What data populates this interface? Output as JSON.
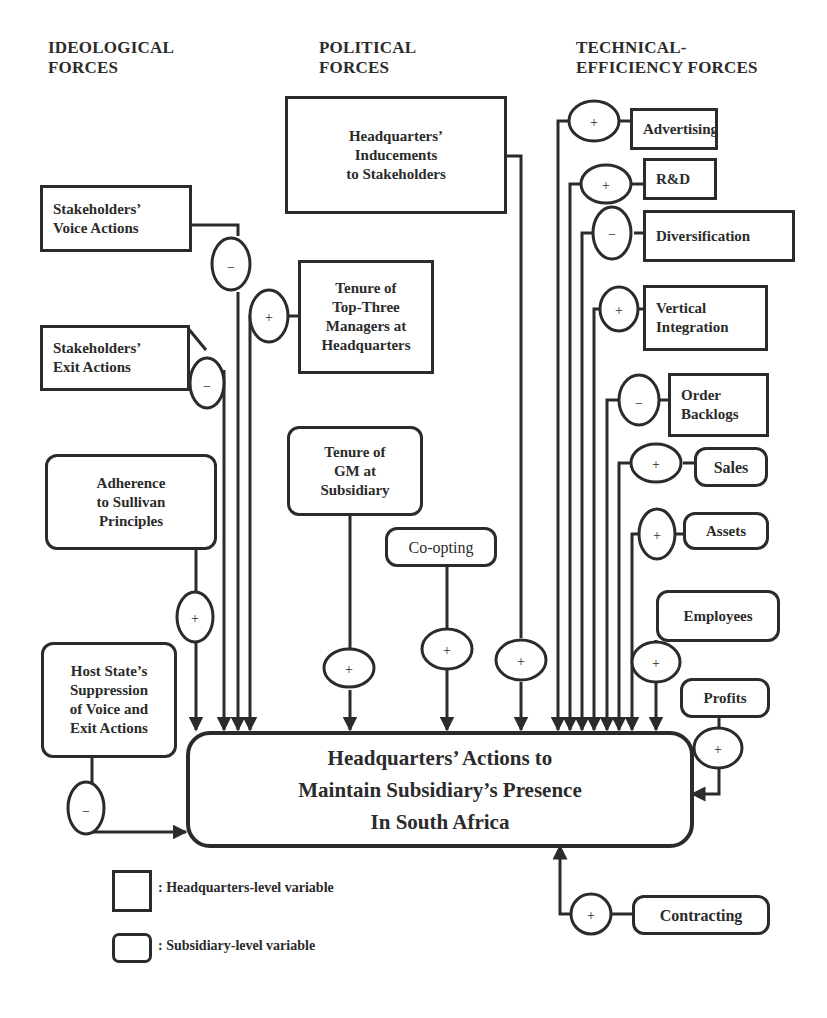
{
  "headings": {
    "ideological": "IDEOLOGICAL\nFORCES",
    "political": "POLITICAL\nFORCES",
    "technical": "TECHNICAL-\nEFFICIENCY FORCES"
  },
  "central": {
    "label": "Headquarters’ Actions to\nMaintain Subsidiary’s Presence\nIn South Africa"
  },
  "nodes": {
    "hq_inducements": "Headquarters’\nInducements\nto Stakeholders",
    "voice_actions": "Stakeholders’\nVoice Actions",
    "exit_actions": "Stakeholders’\nExit Actions",
    "tenure_top_three": "Tenure of\nTop-Three\nManagers at\nHeadquarters",
    "sullivan": "Adherence\nto Sullivan\nPrinciples",
    "host_state": "Host State’s\nSuppression\nof Voice and\nExit Actions",
    "tenure_gm": "Tenure of\nGM at\nSubsidiary",
    "co_opting": "Co-opting",
    "advertising": "Advertising",
    "rd": "R&D",
    "diversification": "Diversification",
    "vertical_integration": "Vertical\nIntegration",
    "order_backlogs": "Order\nBacklogs",
    "sales": "Sales",
    "assets": "Assets",
    "employees": "Employees",
    "profits": "Profits",
    "contracting": "Contracting"
  },
  "signs": {
    "voice_actions": "−",
    "exit_actions": "−",
    "tenure_top_three": "+",
    "sullivan": "+",
    "host_state": "−",
    "tenure_gm": "+",
    "co_opting": "+",
    "hq_inducements": "+",
    "advertising": "+",
    "rd": "+",
    "diversification": "−",
    "vertical_integration": "+",
    "order_backlogs": "−",
    "sales": "+",
    "assets": "+",
    "employees": "+",
    "profits": "+",
    "contracting": "+"
  },
  "legend": {
    "hq_level": ": Headquarters-level variable",
    "sub_level": ": Subsidiary-level variable"
  }
}
